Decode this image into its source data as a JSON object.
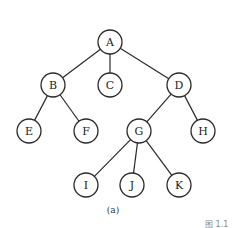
{
  "diagram": {
    "type": "tree",
    "nodes": [
      {
        "id": "A",
        "label": "A",
        "x": 110,
        "y": 42
      },
      {
        "id": "B",
        "label": "B",
        "x": 53,
        "y": 85
      },
      {
        "id": "C",
        "label": "C",
        "x": 110,
        "y": 85
      },
      {
        "id": "D",
        "label": "D",
        "x": 179,
        "y": 85
      },
      {
        "id": "E",
        "label": "E",
        "x": 29,
        "y": 131
      },
      {
        "id": "F",
        "label": "F",
        "x": 86,
        "y": 131
      },
      {
        "id": "G",
        "label": "G",
        "x": 139,
        "y": 131
      },
      {
        "id": "H",
        "label": "H",
        "x": 203,
        "y": 131
      },
      {
        "id": "I",
        "label": "I",
        "x": 86,
        "y": 185
      },
      {
        "id": "J",
        "label": "J",
        "x": 132,
        "y": 185
      },
      {
        "id": "K",
        "label": "K",
        "x": 179,
        "y": 185
      }
    ],
    "edges": [
      [
        "A",
        "B"
      ],
      [
        "A",
        "C"
      ],
      [
        "A",
        "D"
      ],
      [
        "B",
        "E"
      ],
      [
        "B",
        "F"
      ],
      [
        "D",
        "G"
      ],
      [
        "D",
        "H"
      ],
      [
        "G",
        "I"
      ],
      [
        "G",
        "J"
      ],
      [
        "G",
        "K"
      ]
    ],
    "caption": "(a)",
    "figure_label": "图 1.1"
  }
}
